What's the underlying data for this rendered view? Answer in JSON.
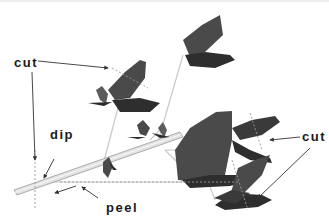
{
  "labels": {
    "cut_left": "cut",
    "dip": "dip",
    "peel": "peel",
    "cut_right": "cut"
  },
  "colors": {
    "leaf_dark": "#2e2e2e",
    "leaf_mid": "#4a4a4a",
    "leaf_light": "#5c5c5c",
    "stem": "#d8d8d8",
    "stem_edge": "#9a9a9a",
    "arrow": "#333333",
    "guide": "#bbbbbb"
  }
}
